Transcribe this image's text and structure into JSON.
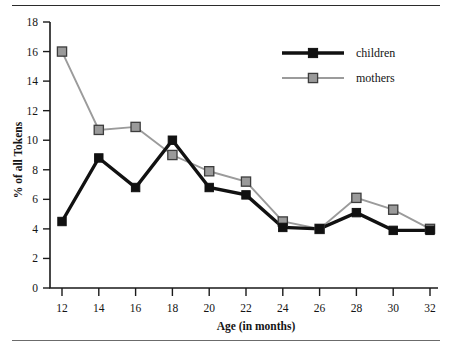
{
  "figure": {
    "has_top_rule": true,
    "has_bottom_rule": true,
    "background_color": "#ffffff"
  },
  "chart_data": {
    "type": "line",
    "title": "",
    "subtitle": "",
    "xlabel": "Age (in months)",
    "ylabel": "% of all Tokens",
    "x": [
      12,
      14,
      16,
      18,
      20,
      22,
      24,
      26,
      28,
      30,
      32
    ],
    "categories": [
      "12",
      "14",
      "16",
      "18",
      "20",
      "22",
      "24",
      "26",
      "28",
      "30",
      "32"
    ],
    "xlim": [
      11,
      33
    ],
    "ylim": [
      0,
      18
    ],
    "xticks": [
      12,
      14,
      16,
      18,
      20,
      22,
      24,
      26,
      28,
      30,
      32
    ],
    "yticks": [
      0,
      2,
      4,
      6,
      8,
      10,
      12,
      14,
      16,
      18
    ],
    "xtick_labels": [
      "12",
      "14",
      "16",
      "18",
      "20",
      "22",
      "24",
      "26",
      "28",
      "30",
      "32"
    ],
    "ytick_labels": [
      "0",
      "2",
      "4",
      "6",
      "8",
      "10",
      "12",
      "14",
      "16",
      "18"
    ],
    "grid": false,
    "legend_position": "top-right",
    "series": [
      {
        "name": "children",
        "color": "#111111",
        "marker": "square-filled",
        "line_width": "thick",
        "values": [
          4.5,
          8.8,
          6.8,
          10.0,
          6.8,
          6.3,
          4.1,
          4.0,
          5.1,
          3.9,
          3.9
        ]
      },
      {
        "name": "mothers",
        "color": "#9a9a9a",
        "marker": "square-filled",
        "line_width": "thin",
        "values": [
          16.0,
          10.7,
          10.9,
          9.0,
          7.9,
          7.2,
          4.5,
          4.0,
          6.1,
          5.3,
          4.0
        ]
      }
    ]
  },
  "legend": {
    "entries": [
      {
        "label": "children"
      },
      {
        "label": "mothers"
      }
    ]
  }
}
